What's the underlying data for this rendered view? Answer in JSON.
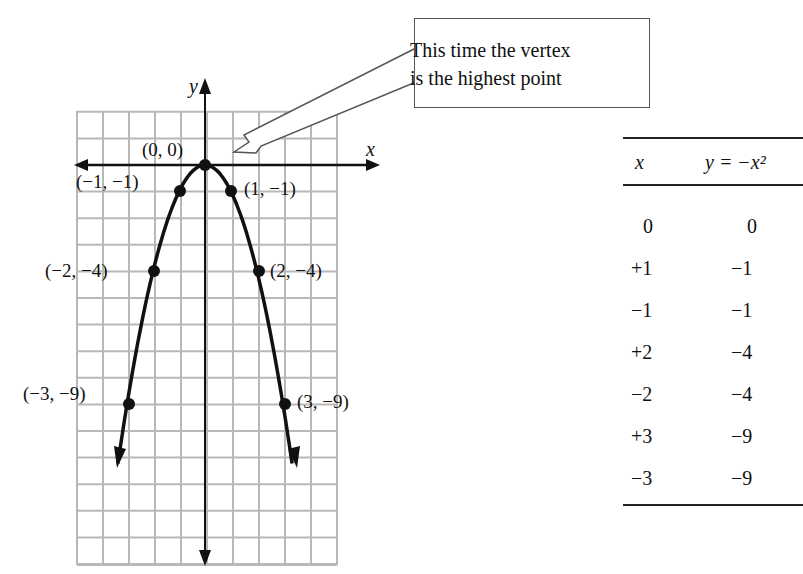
{
  "callout": {
    "line1": "This time the vertex",
    "line2": "is the highest point"
  },
  "axes": {
    "x_label": "x",
    "y_label": "y"
  },
  "points": [
    {
      "label": "(0, 0)"
    },
    {
      "label": "(−1, −1)"
    },
    {
      "label": "(1, −1)"
    },
    {
      "label": "(−2, −4)"
    },
    {
      "label": "(2, −4)"
    },
    {
      "label": "(−3, −9)"
    },
    {
      "label": "(3, −9)"
    }
  ],
  "table": {
    "col_x": "x",
    "col_y": "y = −x²",
    "rows": [
      {
        "x": "0",
        "y": "0"
      },
      {
        "x": "+1",
        "y": "−1"
      },
      {
        "x": "−1",
        "y": "−1"
      },
      {
        "x": "+2",
        "y": "−4"
      },
      {
        "x": "−2",
        "y": "−4"
      },
      {
        "x": "+3",
        "y": "−9"
      },
      {
        "x": "−3",
        "y": "−9"
      }
    ]
  },
  "chart_data": {
    "type": "line",
    "title": "",
    "function": "y = -x^2",
    "xlabel": "x",
    "ylabel": "y",
    "x": [
      -3,
      -2,
      -1,
      0,
      1,
      2,
      3
    ],
    "values": [
      -9,
      -4,
      -1,
      0,
      -1,
      -4,
      -9
    ],
    "point_labels": [
      "(−3, −9)",
      "(−2, −4)",
      "(−1, −1)",
      "(0, 0)",
      "(1, −1)",
      "(2, −4)",
      "(3, −9)"
    ],
    "xlim": [
      -5,
      5
    ],
    "ylim": [
      -15,
      2
    ],
    "grid": true,
    "annotation": "This time the vertex is the highest point"
  }
}
